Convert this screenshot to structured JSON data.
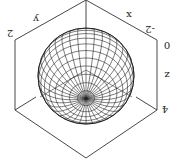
{
  "chart_data": {
    "type": "surface3d",
    "title": "",
    "rotation_deg": 180,
    "axes": {
      "x": {
        "label": "x"
      },
      "y": {
        "label": "y"
      },
      "z": {
        "label": "z",
        "ticks": [
          "-2",
          "0",
          "4"
        ]
      }
    },
    "tick_labels": [
      "-2",
      "0",
      "4",
      "2"
    ],
    "sphere": {
      "center_px": [
        86,
        76
      ],
      "radius_px": 48,
      "latitude_lines": 18,
      "meridian_lines": 36,
      "view_tilt_deg": 62,
      "line_color": "#222222"
    },
    "box": {
      "line_color": "#333333",
      "top_vertex": [
        86,
        0
      ],
      "upper_left": [
        15,
        40
      ],
      "upper_right": [
        157,
        40
      ],
      "lower_left": [
        15,
        110
      ],
      "lower_right": [
        157,
        110
      ],
      "bottom_vertex": [
        86,
        158
      ],
      "inner_vertex": [
        86,
        70
      ],
      "sphere_top_connect": [
        86,
        28
      ]
    }
  },
  "labels": {
    "y_axis": "y",
    "x_axis": "x",
    "z_axis": "z",
    "tick_upper_left": "2",
    "tick_upper_right": "-2",
    "tick_z_0": "0",
    "tick_z_4": "4"
  }
}
